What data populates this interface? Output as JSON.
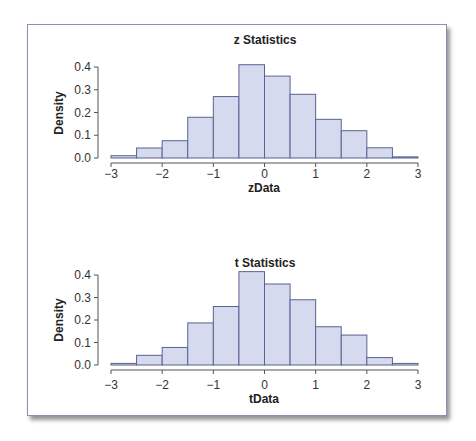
{
  "figure": {
    "frame_color": "#8a8fb0",
    "bar_fill": "#d5daee",
    "bar_stroke": "#5b6192"
  },
  "chart_data": [
    {
      "type": "bar",
      "title": "z Statistics",
      "xlabel": "zData",
      "ylabel": "Density",
      "bin_edges": [
        -3,
        -2.5,
        -2,
        -1.5,
        -1,
        -0.5,
        0,
        0.5,
        1,
        1.5,
        2,
        2.5,
        3
      ],
      "values": [
        0.01,
        0.044,
        0.076,
        0.179,
        0.27,
        0.41,
        0.36,
        0.28,
        0.17,
        0.12,
        0.045,
        0.005
      ],
      "xlim": [
        -3,
        3
      ],
      "ylim": [
        0,
        0.4
      ],
      "xticks": [
        "-3",
        "-2",
        "-1",
        "0",
        "1",
        "2",
        "3"
      ],
      "yticks": [
        "0.0",
        "0.1",
        "0.2",
        "0.3",
        "0.4"
      ],
      "grid": false
    },
    {
      "type": "bar",
      "title": "t Statistics",
      "xlabel": "tData",
      "ylabel": "Density",
      "bin_edges": [
        -3,
        -2.5,
        -2,
        -1.5,
        -1,
        -0.5,
        0,
        0.5,
        1,
        1.5,
        2,
        2.5,
        3
      ],
      "values": [
        0.007,
        0.043,
        0.078,
        0.187,
        0.26,
        0.415,
        0.36,
        0.29,
        0.17,
        0.133,
        0.033,
        0.007
      ],
      "xlim": [
        -3,
        3
      ],
      "ylim": [
        0,
        0.4
      ],
      "xticks": [
        "-3",
        "-2",
        "-1",
        "0",
        "1",
        "2",
        "3"
      ],
      "yticks": [
        "0.0",
        "0.1",
        "0.2",
        "0.3",
        "0.4"
      ],
      "grid": false
    }
  ]
}
